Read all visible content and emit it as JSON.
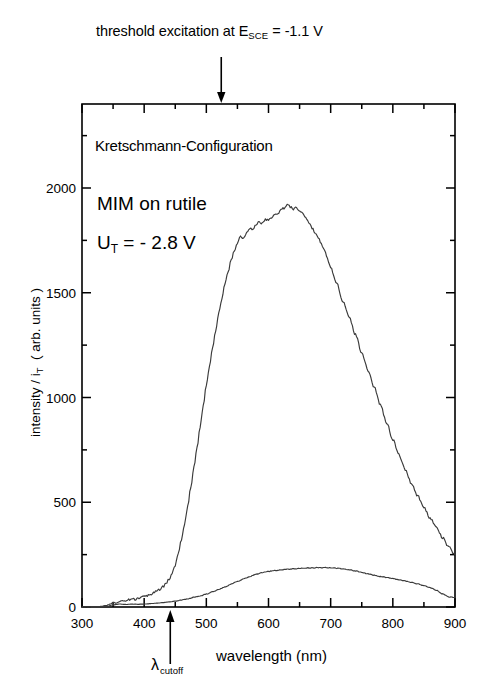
{
  "figure": {
    "caption_top": {
      "prefix": "threshold excitation at E",
      "subscript": "SCE",
      "suffix": "= -1.1 V"
    },
    "annotations": {
      "configuration": "Kretschmann-Configuration",
      "sample": "MIM on rutile",
      "voltage_symbol": "U",
      "voltage_subscript": "T",
      "voltage_value": "= -  2.8 V"
    },
    "cutoff_marker": {
      "symbol": "λ",
      "subscript": "cutoff"
    },
    "colors": {
      "axis": "#000000",
      "curve": "#3a3a3a",
      "background": "#ffffff"
    }
  },
  "chart_data": {
    "type": "line",
    "xlabel": "wavelength (nm)",
    "ylabel": "intensity / i T ( arb. units )",
    "xlim": [
      300,
      900
    ],
    "ylim": [
      0,
      2300
    ],
    "xticks": [
      300,
      400,
      500,
      600,
      700,
      800,
      900
    ],
    "xtick_labels": [
      "300",
      "400",
      "500",
      "600",
      "700",
      "800",
      "900"
    ],
    "xminor_step": 50,
    "yticks": [
      0,
      500,
      1000,
      1500,
      2000
    ],
    "ytick_labels": [
      "0",
      "500",
      "1000",
      "1500",
      "2000"
    ],
    "yminor_step": 250,
    "grid": false,
    "legend": null,
    "annotations": [
      {
        "text": "threshold excitation at E_SCE = -1.1 V",
        "x": 524,
        "type": "arrow-down-top"
      },
      {
        "text": "λ_cutoff",
        "x": 442,
        "type": "arrow-up-bottom"
      },
      {
        "text": "Kretschmann-Configuration",
        "x": 355,
        "y": 2120
      },
      {
        "text": "MIM on rutile",
        "x": 360,
        "y": 1850
      },
      {
        "text": "U_T = - 2.8 V",
        "x": 360,
        "y": 1660
      }
    ],
    "series": [
      {
        "name": "MIM on rutile, U_T = -2.8 V (emission)",
        "x": [
          300,
          310,
          320,
          330,
          340,
          345,
          350,
          355,
          360,
          365,
          370,
          375,
          380,
          385,
          390,
          395,
          400,
          405,
          410,
          415,
          420,
          425,
          430,
          435,
          440,
          445,
          450,
          455,
          460,
          465,
          470,
          475,
          480,
          485,
          490,
          495,
          500,
          505,
          510,
          515,
          520,
          525,
          530,
          535,
          540,
          545,
          550,
          555,
          560,
          565,
          570,
          575,
          580,
          585,
          590,
          595,
          600,
          605,
          610,
          615,
          620,
          625,
          630,
          635,
          640,
          645,
          650,
          655,
          660,
          665,
          670,
          675,
          680,
          685,
          690,
          695,
          700,
          710,
          720,
          730,
          740,
          750,
          760,
          770,
          780,
          790,
          800,
          810,
          820,
          830,
          840,
          850,
          860,
          870,
          880,
          890,
          900
        ],
        "y": [
          0,
          0,
          0,
          2,
          8,
          14,
          22,
          18,
          26,
          30,
          28,
          34,
          38,
          36,
          42,
          46,
          50,
          54,
          60,
          66,
          74,
          84,
          96,
          112,
          132,
          160,
          200,
          255,
          320,
          395,
          480,
          570,
          665,
          760,
          860,
          960,
          1060,
          1150,
          1240,
          1320,
          1400,
          1475,
          1540,
          1600,
          1655,
          1700,
          1740,
          1770,
          1760,
          1790,
          1810,
          1800,
          1825,
          1840,
          1830,
          1850,
          1845,
          1860,
          1870,
          1880,
          1895,
          1905,
          1920,
          1910,
          1900,
          1905,
          1890,
          1880,
          1860,
          1835,
          1810,
          1785,
          1760,
          1735,
          1700,
          1660,
          1620,
          1540,
          1460,
          1380,
          1300,
          1215,
          1130,
          1050,
          965,
          880,
          800,
          725,
          655,
          590,
          530,
          475,
          425,
          380,
          330,
          285,
          250
        ],
        "style": "solid",
        "color": "#3a3a3a",
        "peak": {
          "x": 630,
          "y": 1920
        }
      },
      {
        "name": "background / reference",
        "x": [
          300,
          320,
          340,
          350,
          360,
          370,
          380,
          390,
          400,
          410,
          420,
          430,
          440,
          450,
          460,
          470,
          480,
          490,
          500,
          510,
          520,
          530,
          540,
          550,
          560,
          570,
          580,
          590,
          600,
          610,
          620,
          630,
          640,
          650,
          660,
          670,
          680,
          690,
          700,
          710,
          720,
          730,
          740,
          750,
          760,
          770,
          780,
          790,
          800,
          810,
          820,
          830,
          840,
          850,
          860,
          870,
          880,
          890,
          900
        ],
        "y": [
          0,
          0,
          3,
          10,
          14,
          12,
          14,
          13,
          14,
          16,
          18,
          21,
          24,
          28,
          33,
          39,
          46,
          53,
          62,
          72,
          84,
          96,
          109,
          122,
          134,
          146,
          156,
          164,
          170,
          174,
          177,
          180,
          182,
          184,
          186,
          187,
          188,
          188,
          187,
          185,
          182,
          178,
          172,
          165,
          158,
          152,
          146,
          141,
          136,
          130,
          124,
          117,
          110,
          102,
          92,
          80,
          62,
          48,
          45
        ],
        "style": "solid",
        "color": "#3a3a3a",
        "peak": {
          "x": 685,
          "y": 188
        }
      }
    ]
  }
}
